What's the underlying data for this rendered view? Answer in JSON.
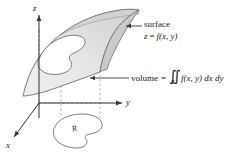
{
  "figure": {
    "background_color": "#ffffff",
    "line_color": "#4d4d4d",
    "surface_fill_light": "#ececec",
    "surface_fill_dark": "#d8d8d8",
    "text_color": "#1a1a1a"
  },
  "axes": {
    "z_label": "z",
    "y_label": "y",
    "x_label": "x"
  },
  "callouts": {
    "surface_label": "surface",
    "surface_equation_lhs": "z",
    "surface_equation_eq": "=",
    "surface_equation_rhs": "f(x, y)",
    "volume_label": "volume",
    "volume_eq": "=",
    "volume_integral_symbol": "∬",
    "volume_integral_subscript": "R",
    "volume_integrand": "f(x, y) dx dy"
  },
  "region": {
    "label": "R"
  }
}
